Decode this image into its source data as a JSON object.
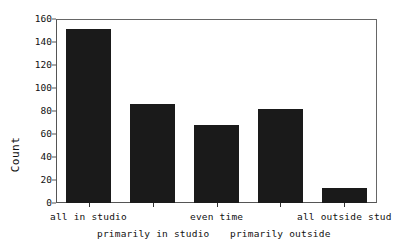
{
  "chart_data": {
    "type": "bar",
    "title": "",
    "xlabel": "",
    "ylabel": "Count",
    "categories": [
      "all in studio",
      "primarily in studio",
      "even time",
      "primarily outside",
      "all outside stud"
    ],
    "values": [
      151,
      86,
      68,
      82,
      13
    ],
    "ylim": [
      0,
      160
    ],
    "yticks": [
      0,
      20,
      40,
      60,
      80,
      100,
      120,
      140,
      160
    ],
    "ytick_labels": [
      "0",
      "20",
      "40",
      "60",
      "80",
      "100",
      "120",
      "140",
      "160"
    ],
    "grid": false,
    "legend": null,
    "bar_color": "#1a1a1a",
    "axis_color": "#555555",
    "background": "#ffffff",
    "note": "last category label is truncated at the right image edge"
  },
  "axis": {
    "y_title": "Count"
  }
}
